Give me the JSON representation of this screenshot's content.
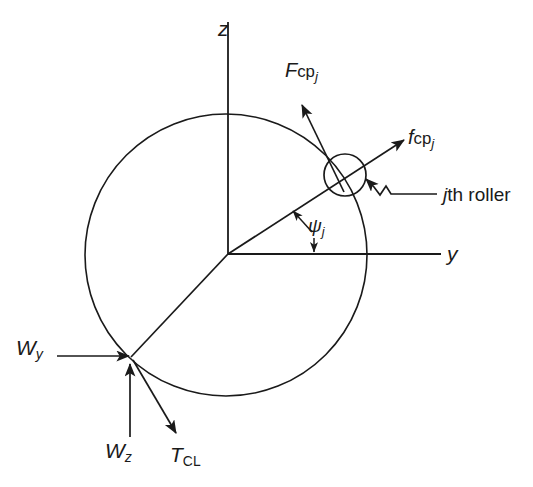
{
  "figure": {
    "background_color": "#ffffff",
    "line_color": "#1a1a1a",
    "axes": {
      "vertical_axis_label": "z",
      "horizontal_axis_label": "y",
      "origin": {
        "x": 228,
        "y": 254
      },
      "vertical_axis": {
        "x": 228,
        "y_top": 22,
        "y_bottom": 254
      },
      "horizontal_axis": {
        "y": 254,
        "x_left": 228,
        "x_right": 441
      }
    },
    "bearing_circle": {
      "center_x": 226,
      "center_y": 255,
      "radius": 141,
      "name": "bearing-outer-race"
    },
    "roller": {
      "label": "jth roller",
      "label_italic_prefix": "j",
      "label_rest": "th roller",
      "center_x": 345,
      "center_y": 175,
      "radius": 21,
      "angle_deg_from_y_axis": 33
    },
    "vectors": [
      {
        "name": "Fcpj",
        "label_base": "F",
        "label_mid": "cp",
        "label_sub": "j",
        "base_style": "italic",
        "mid_style": "upright",
        "sub_style": "italic",
        "description": "cage-pocket reaction force on jth roller",
        "from": {
          "x": 344,
          "y": 190
        },
        "to": {
          "x": 302,
          "y": 105
        }
      },
      {
        "name": "fcpj",
        "label_base": "f",
        "label_mid": "cp",
        "label_sub": "j",
        "base_style": "italic",
        "mid_style": "upright",
        "sub_style": "italic",
        "description": "roller contact force along radial line",
        "from": {
          "x": 228,
          "y": 254
        },
        "to": {
          "x": 404,
          "y": 140
        }
      },
      {
        "name": "Wy",
        "label_base": "W",
        "label_sub": "y",
        "base_style": "italic",
        "sub_style": "italic",
        "description": "radial load component along y",
        "from": {
          "x": 58,
          "y": 356
        },
        "to": {
          "x": 128,
          "y": 356
        }
      },
      {
        "name": "Wz",
        "label_base": "W",
        "label_sub": "z",
        "base_style": "italic",
        "sub_style": "italic",
        "description": "radial load component along z",
        "from": {
          "x": 130,
          "y": 437
        },
        "to": {
          "x": 130,
          "y": 363
        }
      },
      {
        "name": "TCL",
        "label_base": "T",
        "label_sub": "CL",
        "base_style": "italic",
        "sub_style": "upright",
        "description": "cage-land traction force",
        "from": {
          "x": 131,
          "y": 358
        },
        "to": {
          "x": 175,
          "y": 432
        }
      }
    ],
    "angle_marker": {
      "label_base": "ψ",
      "label_sub": "j",
      "base_style": "italic",
      "sub_style": "italic",
      "description": "angular position of jth roller measured from y axis",
      "upper_arrow_to": {
        "x": 292,
        "y": 210
      },
      "lower_arrow_to": {
        "x": 313,
        "y": 252
      }
    },
    "leader": {
      "name": "roller-leader-line",
      "description": "stepped leader from jth roller text to roller circle",
      "points": [
        {
          "x": 437,
          "y": 194
        },
        {
          "x": 391,
          "y": 194
        },
        {
          "x": 386,
          "y": 187
        },
        {
          "x": 381,
          "y": 194
        },
        {
          "x": 374,
          "y": 188
        },
        {
          "x": 366,
          "y": 179
        }
      ]
    }
  }
}
